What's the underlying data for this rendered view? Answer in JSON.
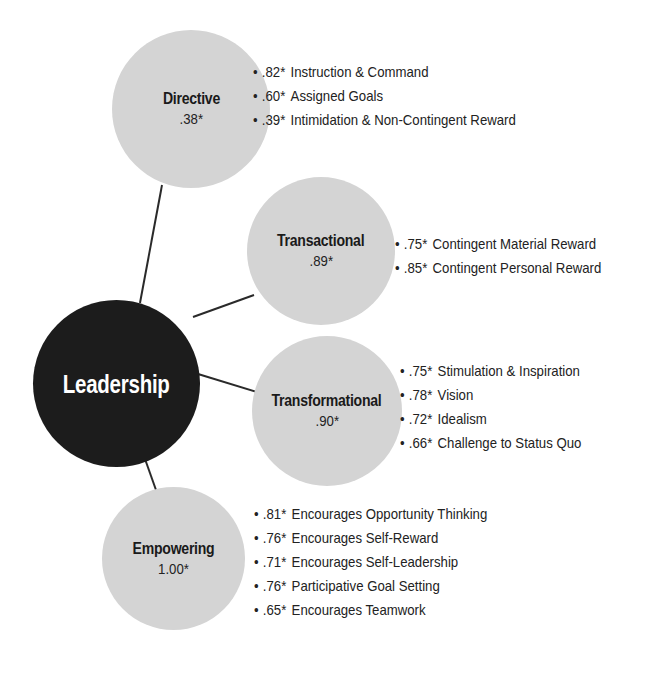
{
  "diagram": {
    "hub": {
      "label": "Leadership",
      "color": "#1c1c1c"
    },
    "node_color": "#d4d4d4",
    "connector_color": "#2a2a2a",
    "factors": [
      {
        "label": "Directive",
        "loading": ".38*",
        "items": [
          {
            "loading": ".82*",
            "label": "Instruction & Command"
          },
          {
            "loading": ".60*",
            "label": "Assigned Goals"
          },
          {
            "loading": ".39*",
            "label": "Intimidation & Non-Contingent Reward"
          }
        ]
      },
      {
        "label": "Transactional",
        "loading": ".89*",
        "items": [
          {
            "loading": ".75*",
            "label": "Contingent Material Reward"
          },
          {
            "loading": ".85*",
            "label": "Contingent Personal Reward"
          }
        ]
      },
      {
        "label": "Transformational",
        "loading": ".90*",
        "items": [
          {
            "loading": ".75*",
            "label": "Stimulation & Inspiration"
          },
          {
            "loading": ".78*",
            "label": "Vision"
          },
          {
            "loading": ".72*",
            "label": "Idealism"
          },
          {
            "loading": ".66*",
            "label": "Challenge to Status Quo"
          }
        ]
      },
      {
        "label": "Empowering",
        "loading": "1.00*",
        "items": [
          {
            "loading": ".81*",
            "label": "Encourages Opportunity Thinking"
          },
          {
            "loading": ".76*",
            "label": "Encourages Self-Reward"
          },
          {
            "loading": ".71*",
            "label": "Encourages Self-Leadership"
          },
          {
            "loading": ".76*",
            "label": "Participative Goal Setting"
          },
          {
            "loading": ".65*",
            "label": "Encourages Teamwork"
          }
        ]
      }
    ],
    "bullet": "•"
  }
}
